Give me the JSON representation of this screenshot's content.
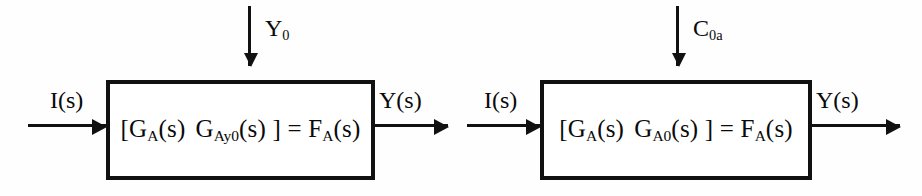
{
  "diagram": {
    "background_color": "#ffffff",
    "line_color": "#111111",
    "systems": [
      {
        "id": "left",
        "input_label": "I(s)",
        "output_label": "Y(s)",
        "disturbance_label_main": "Y",
        "disturbance_label_sub": "0",
        "block_text": {
          "open_bracket": "[",
          "term1_main": "G",
          "term1_sub": "A",
          "term1_arg": "(s)",
          "term2_main": "G",
          "term2_sub": "Ay0",
          "term2_arg": "(s)",
          "close_bracket": "]",
          "equals": "=",
          "result_main": "F",
          "result_sub": "A",
          "result_arg": "(s)"
        }
      },
      {
        "id": "right",
        "input_label": "I(s)",
        "output_label": "Y(s)",
        "disturbance_label_main": "C",
        "disturbance_label_sub": "0a",
        "block_text": {
          "open_bracket": "[",
          "term1_main": "G",
          "term1_sub": "A",
          "term1_arg": "(s)",
          "term2_main": "G",
          "term2_sub": "A0",
          "term2_arg": "(s)",
          "close_bracket": "]",
          "equals": "=",
          "result_main": "F",
          "result_sub": "A",
          "result_arg": "(s)"
        }
      }
    ]
  }
}
